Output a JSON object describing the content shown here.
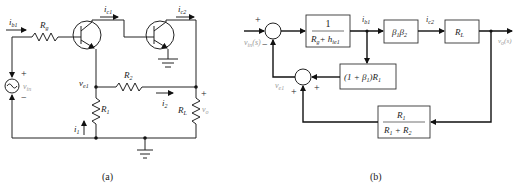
{
  "figure": {
    "part_a": {
      "caption": "(a)",
      "labels": {
        "ib1": "i",
        "ib1_sub": "b1",
        "Rg": "R",
        "Rg_sub": "g",
        "ic1": "i",
        "ic1_sub": "c1",
        "ic2": "i",
        "ic2_sub": "c2",
        "vin": "v",
        "vin_sub": "in",
        "ve1": "v",
        "ve1_sub": "e1",
        "R2": "R",
        "R2_sub": "2",
        "R1": "R",
        "R1_sub": "1",
        "i1": "i",
        "i1_sub": "1",
        "i2": "i",
        "i2_sub": "2",
        "RL": "R",
        "RL_sub": "L",
        "vo": "v",
        "vo_sub": "o",
        "plus": "+",
        "minus": "−"
      }
    },
    "part_b": {
      "caption": "(b)",
      "input": "v",
      "input_sub": "in",
      "input_arg": "(s)",
      "output": "v",
      "output_sub": "o",
      "output_arg": "(s)",
      "blocks": {
        "gain1_num": "1",
        "gain1_den": "R",
        "gain1_den_sub": "g",
        "gain1_den_plus": "+ h",
        "gain1_den_sub2": "ie1",
        "beta_prod": "β",
        "beta_sub1": "1",
        "beta2": "β",
        "beta_sub2": "2",
        "load": "R",
        "load_sub": "L",
        "emitter": "(1 + β",
        "emitter_sub": "1",
        "emitter_tail": ")R",
        "emitter_sub2": "1",
        "divider_num": "R",
        "divider_num_sub": "1",
        "divider_den": "R",
        "divider_den_sub1": "1",
        "divider_den_plus": " + R",
        "divider_den_sub2": "2"
      },
      "signals": {
        "ib1": "i",
        "ib1_sub": "b1",
        "ic2": "i",
        "ic2_sub": "c2",
        "ve1": "v",
        "ve1_sub": "e1"
      },
      "signs": {
        "sum1_in": "+",
        "sum1_fb": "−",
        "sum2_a": "+",
        "sum2_b": "+"
      }
    }
  }
}
